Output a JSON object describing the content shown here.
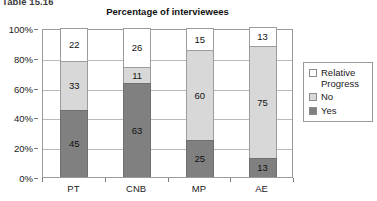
{
  "caption": "Table 15.16",
  "chart_data": {
    "type": "bar",
    "subtype": "stacked-100-percent",
    "title": "Percentage of interviewees",
    "xlabel": "",
    "ylabel": "",
    "categories": [
      "PT",
      "CNB",
      "MP",
      "AE"
    ],
    "ylim": [
      0,
      100
    ],
    "yticks": [
      "0%",
      "20%",
      "40%",
      "60%",
      "80%",
      "100%"
    ],
    "ytick_values": [
      0,
      20,
      40,
      60,
      80,
      100
    ],
    "grid": true,
    "legend_position": "right",
    "series": [
      {
        "name": "Yes",
        "color": "#808080",
        "values": [
          45,
          63,
          25,
          13
        ]
      },
      {
        "name": "No",
        "color": "#d8d8d8",
        "values": [
          33,
          11,
          60,
          75
        ]
      },
      {
        "name": "Relative Progress",
        "color": "#ffffff",
        "values": [
          22,
          26,
          15,
          13
        ]
      }
    ],
    "legend_entries": [
      {
        "label": "Relative Progress",
        "color": "#ffffff"
      },
      {
        "label": "No",
        "color": "#d8d8d8"
      },
      {
        "label": "Yes",
        "color": "#808080"
      }
    ]
  }
}
